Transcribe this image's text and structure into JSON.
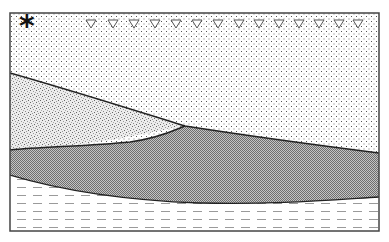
{
  "diagram": {
    "type": "geological-cross-section",
    "frame": {
      "x": 10,
      "y": 13,
      "width": 369,
      "height": 218
    },
    "marker": {
      "symbol": "*",
      "x": 19,
      "y": 11
    },
    "water_table_symbols": {
      "symbol": "▽",
      "count": 14,
      "y": 24,
      "x_positions": [
        91,
        113,
        134,
        155,
        176,
        197,
        218,
        239,
        259,
        279,
        299,
        319,
        339,
        358
      ]
    },
    "layers": [
      {
        "name": "upper-dotted-layer",
        "pattern": "sparse-dots",
        "fill": "#ffffff"
      },
      {
        "name": "fine-sand-wedge",
        "pattern": "dense-stipple",
        "fill": "#e6e6e6"
      },
      {
        "name": "dark-lens-layer",
        "pattern": "checker",
        "fill": "#9a9a9a"
      },
      {
        "name": "lower-dashed-layer",
        "pattern": "dashed-lines",
        "fill": "#ffffff"
      }
    ],
    "colors": {
      "line": "#222222",
      "dot": "#555555",
      "dash": "#aaaaaa",
      "stipple": "#777777"
    }
  }
}
